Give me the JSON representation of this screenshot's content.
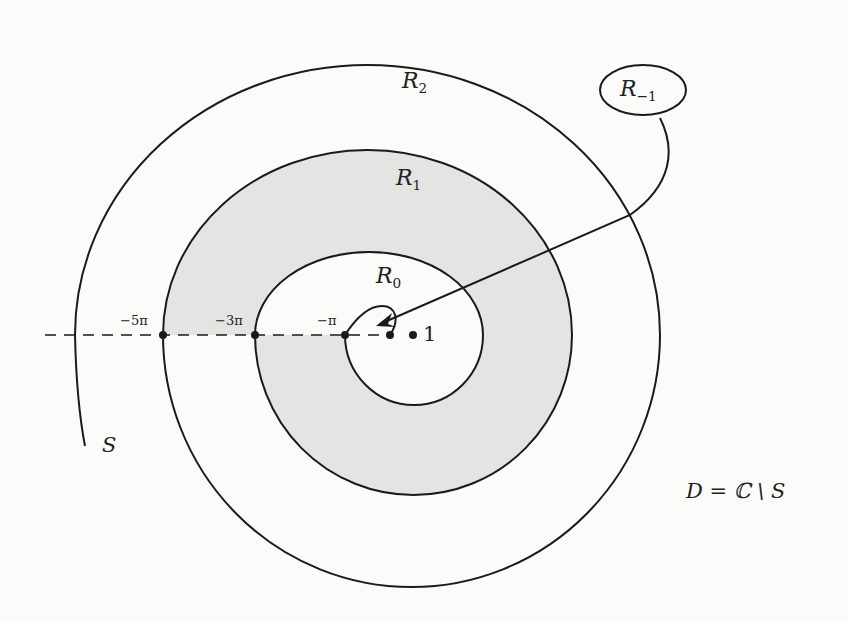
{
  "figure": {
    "region_labels": [
      {
        "id": "R2",
        "base": "R",
        "sub": "2"
      },
      {
        "id": "R1",
        "base": "R",
        "sub": "1"
      },
      {
        "id": "R0",
        "base": "R",
        "sub": "0"
      },
      {
        "id": "R-1",
        "base": "R",
        "sub": "−1"
      }
    ],
    "axis_ticks": [
      {
        "label": "−5π"
      },
      {
        "label": "−3π"
      },
      {
        "label": "−π"
      },
      {
        "label": "1"
      }
    ],
    "curve_label": "S",
    "domain_equation": "D = ℂ \\ S",
    "colors": {
      "stroke": "#1a1a1a",
      "shading": "#e4e4e2",
      "background": "#fbfbf9"
    }
  }
}
